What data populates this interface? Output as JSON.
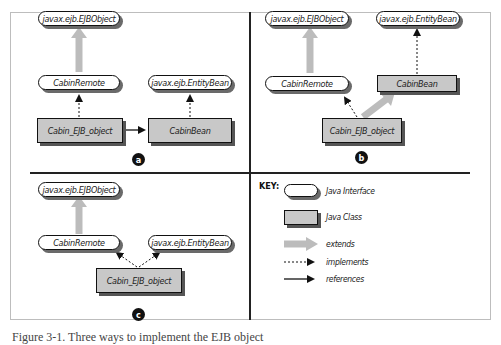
{
  "panels": {
    "a": {
      "badge": "a",
      "ejbobject": "javax.ejb.EJBObject",
      "remote": "CabinRemote",
      "entitybean": "javax.ejb.EntityBean",
      "ejb_object": "Cabin_EJB_object",
      "bean": "CabinBean"
    },
    "b": {
      "badge": "b",
      "ejbobject": "javax.ejb.EJBObject",
      "entitybean": "javax.ejb.EntityBean",
      "remote": "CabinRemote",
      "bean": "CabinBean",
      "ejb_object": "Cabin_EJB_object"
    },
    "c": {
      "badge": "c",
      "ejbobject": "javax.ejb.EJBObject",
      "remote": "CabinRemote",
      "entitybean": "javax.ejb.EntityBean",
      "ejb_object": "Cabin_EJB_object"
    }
  },
  "key": {
    "title": "KEY:",
    "items": [
      {
        "shape": "rounded-white",
        "label": "Java Interface"
      },
      {
        "shape": "gray-rect",
        "label": "Java Class"
      },
      {
        "shape": "thick-gray-arrow",
        "label": "extends"
      },
      {
        "shape": "dotted-arrow",
        "label": "implements"
      },
      {
        "shape": "solid-arrow",
        "label": "references"
      }
    ]
  },
  "colors": {
    "class_fill": "#c8c8c8",
    "extends_arrow": "#bcbcbc",
    "line": "#111111"
  },
  "caption": "Figure 3-1. Three ways to implement the EJB object"
}
